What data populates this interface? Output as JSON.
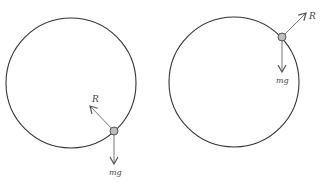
{
  "diagrams": [
    {
      "id": "left",
      "position_description": "particle near bottom-right of circle",
      "circle": {
        "cx": 71,
        "cy": 83,
        "r": 65
      },
      "particle": {
        "x": 114,
        "y": 131
      },
      "force_reaction": {
        "label": "R",
        "direction": "toward center (up-left)"
      },
      "force_weight": {
        "label": "mg",
        "direction": "down"
      }
    },
    {
      "id": "right",
      "position_description": "particle near top-right of circle",
      "circle": {
        "cx": 234,
        "cy": 82,
        "r": 65
      },
      "particle": {
        "x": 282,
        "y": 37
      },
      "force_reaction": {
        "label": "R",
        "direction": "away from center (up-right)"
      },
      "force_weight": {
        "label": "mg",
        "direction": "down"
      }
    }
  ],
  "colors": {
    "circle_stroke": "#333333",
    "arrow": "#555555",
    "particle_fill": "#bdbdbd",
    "particle_stroke": "#555555",
    "text": "#444444"
  }
}
